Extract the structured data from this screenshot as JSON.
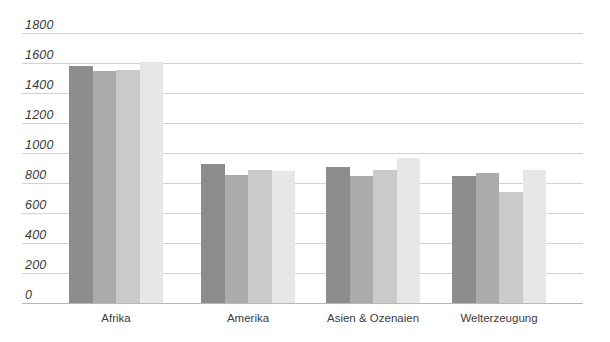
{
  "chart_data": {
    "type": "bar",
    "title": "",
    "subtitle": "",
    "xlabel": "",
    "ylabel": "",
    "ylim": [
      0,
      1800
    ],
    "yticks": [
      0,
      200,
      400,
      600,
      800,
      1000,
      1200,
      1400,
      1600,
      1800
    ],
    "ytick_labels": [
      "0",
      "200",
      "400",
      "600",
      "800",
      "1000",
      "1200",
      "1400",
      "1600",
      "1800"
    ],
    "grid": true,
    "legend": "none",
    "categories": [
      "Afrika",
      "Amerika",
      "Asien & Ozenaien",
      "Welterzeugung"
    ],
    "series": [
      {
        "name": "series-1",
        "color": "#8d8d8d",
        "values": [
          1580,
          930,
          905,
          850
        ]
      },
      {
        "name": "series-2",
        "color": "#ababab",
        "values": [
          1545,
          855,
          845,
          870
        ]
      },
      {
        "name": "series-3",
        "color": "#cacaca",
        "values": [
          1555,
          890,
          885,
          740
        ]
      },
      {
        "name": "series-4",
        "color": "#e7e7e7",
        "values": [
          1610,
          880,
          970,
          885
        ]
      }
    ],
    "colors": {
      "gridline": "#d2d2d2",
      "baseline": "#b8b8b8",
      "tick_text": "#3a3a3a",
      "category_text": "#3c3c3c",
      "background": "#ffffff"
    },
    "layout": {
      "group_starts_px": [
        47,
        179,
        304,
        430
      ],
      "group_width_px": 94,
      "bar_width_px": 23.5,
      "plot_left_px": 22,
      "plot_top_px": 33,
      "plot_width_px": 561,
      "plot_height_px": 270
    }
  }
}
